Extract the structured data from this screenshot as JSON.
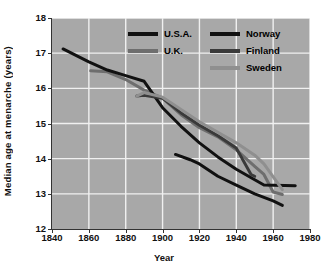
{
  "chart_data": {
    "type": "line",
    "title": "",
    "xlabel": "Year",
    "ylabel": "Median age at menarche (years)",
    "xlim": [
      1840,
      1980
    ],
    "ylim": [
      12,
      18
    ],
    "xticks": [
      1840,
      1860,
      1880,
      1900,
      1920,
      1940,
      1960,
      1980
    ],
    "yticks": [
      12,
      13,
      14,
      15,
      16,
      17,
      18
    ],
    "grid": true,
    "legend_position": "top-center",
    "plot_background": "#a8a8a8",
    "gridline_color": "#f0f0f0",
    "series": [
      {
        "name": "U.S.A.",
        "color": "#111111",
        "points": [
          [
            1907,
            14.12
          ],
          [
            1915,
            13.97
          ],
          [
            1920,
            13.85
          ],
          [
            1930,
            13.5
          ],
          [
            1940,
            13.25
          ],
          [
            1950,
            13.0
          ],
          [
            1960,
            12.8
          ],
          [
            1965,
            12.67
          ]
        ]
      },
      {
        "name": "U.K.",
        "color": "#6e6e6e",
        "points": [
          [
            1861,
            16.5
          ],
          [
            1870,
            16.47
          ],
          [
            1880,
            16.25
          ],
          [
            1890,
            15.95
          ],
          [
            1900,
            15.72
          ],
          [
            1910,
            15.25
          ],
          [
            1920,
            14.88
          ],
          [
            1930,
            14.62
          ],
          [
            1940,
            14.25
          ],
          [
            1950,
            13.78
          ],
          [
            1955,
            13.55
          ],
          [
            1960,
            13.05
          ],
          [
            1965,
            12.98
          ]
        ]
      },
      {
        "name": "Norway",
        "color": "#111111",
        "points": [
          [
            1846,
            17.12
          ],
          [
            1860,
            16.75
          ],
          [
            1870,
            16.52
          ],
          [
            1880,
            16.36
          ],
          [
            1890,
            16.2
          ],
          [
            1900,
            15.45
          ],
          [
            1910,
            14.92
          ],
          [
            1920,
            14.45
          ],
          [
            1930,
            14.05
          ],
          [
            1940,
            13.7
          ],
          [
            1950,
            13.4
          ],
          [
            1955,
            13.25
          ],
          [
            1972,
            13.23
          ]
        ]
      },
      {
        "name": "Finland",
        "color": "#3a3a3a",
        "points": [
          [
            1886,
            15.78
          ],
          [
            1890,
            15.8
          ],
          [
            1900,
            15.72
          ],
          [
            1910,
            15.3
          ],
          [
            1920,
            14.95
          ],
          [
            1930,
            14.65
          ],
          [
            1940,
            14.3
          ],
          [
            1948,
            13.55
          ],
          [
            1950,
            13.5
          ]
        ]
      },
      {
        "name": "Sweden",
        "color": "#8f8f8f",
        "points": [
          [
            1886,
            15.78
          ],
          [
            1890,
            15.88
          ],
          [
            1900,
            15.75
          ],
          [
            1910,
            15.4
          ],
          [
            1920,
            15.05
          ],
          [
            1930,
            14.75
          ],
          [
            1940,
            14.45
          ],
          [
            1950,
            14.1
          ],
          [
            1955,
            13.85
          ],
          [
            1965,
            13.12
          ]
        ]
      }
    ],
    "legend": [
      {
        "label": "U.S.A.",
        "color": "#111111",
        "column": 0
      },
      {
        "label": "U.K.",
        "color": "#6e6e6e",
        "column": 0
      },
      {
        "label": "Norway",
        "color": "#111111",
        "column": 1
      },
      {
        "label": "Finland",
        "color": "#3a3a3a",
        "column": 1
      },
      {
        "label": "Sweden",
        "color": "#8f8f8f",
        "column": 1
      }
    ]
  }
}
